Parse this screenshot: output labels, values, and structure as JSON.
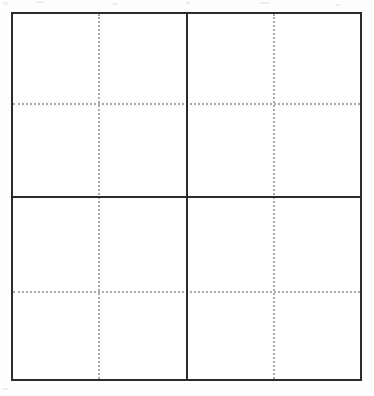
{
  "figure": {
    "background_color": "#fefefe",
    "frame": {
      "label": "outer-frame",
      "x": 11,
      "y": 12,
      "width": 351,
      "height": 369,
      "border_width_px": 2,
      "border_color": "#2b2b2b",
      "fill_color": "#ffffff"
    },
    "grid": {
      "rows": 2,
      "columns": 2,
      "divider_color": "#2b2b2b",
      "divider_width_px": 2,
      "vertical_divider_x": 186,
      "horizontal_divider_y": 196
    },
    "guides": {
      "style": "dotted",
      "color": "#a9a9a9",
      "width_px": 2,
      "dot_pitch_px": 4,
      "vertical_x": [
        98,
        273
      ],
      "horizontal_y": [
        103,
        291
      ]
    },
    "panels": [
      {
        "id": "panel-top-left",
        "label": "top-left",
        "row": 1,
        "column": 1,
        "crosshair_x": 98,
        "crosshair_y": 103,
        "content": ""
      },
      {
        "id": "panel-top-right",
        "label": "top-right",
        "row": 1,
        "column": 2,
        "crosshair_x": 273,
        "crosshair_y": 103,
        "content": ""
      },
      {
        "id": "panel-bottom-left",
        "label": "bottom-left",
        "row": 2,
        "column": 1,
        "crosshair_x": 98,
        "crosshair_y": 291,
        "content": ""
      },
      {
        "id": "panel-bottom-right",
        "label": "bottom-right",
        "row": 2,
        "column": 2,
        "crosshair_x": 273,
        "crosshair_y": 291,
        "content": ""
      }
    ],
    "artifacts": [
      {
        "x": 3,
        "y": 2,
        "width": 5,
        "height": 3
      },
      {
        "x": 36,
        "y": 1,
        "width": 9,
        "height": 2
      },
      {
        "x": 112,
        "y": 3,
        "width": 6,
        "height": 2
      },
      {
        "x": 186,
        "y": 1,
        "width": 4,
        "height": 3
      },
      {
        "x": 259,
        "y": 2,
        "width": 11,
        "height": 2
      },
      {
        "x": 336,
        "y": 4,
        "width": 5,
        "height": 2
      },
      {
        "x": 2,
        "y": 388,
        "width": 7,
        "height": 2
      }
    ]
  }
}
